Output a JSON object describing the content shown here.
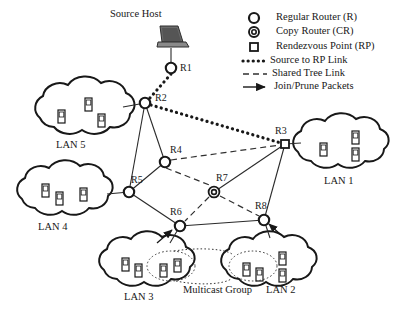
{
  "figure": {
    "source_host_label": "Source Host",
    "multicast_group_label": "Multicast Group"
  },
  "legend": {
    "items": [
      {
        "symbol": "circle-open",
        "label": "Regular Router (R)"
      },
      {
        "symbol": "double-circle",
        "label": "Copy Router (CR)"
      },
      {
        "symbol": "square-open",
        "label": "Rendezvous Point (RP)"
      },
      {
        "symbol": "thick-dotted-line",
        "label": "Source to RP  Link"
      },
      {
        "symbol": "dashed-line",
        "label": "Shared Tree Link"
      },
      {
        "symbol": "arrow-line",
        "label": "Join/Prune Packets"
      }
    ]
  },
  "nodes": [
    {
      "id": "R1",
      "label": "R1",
      "type": "regular-router",
      "x": 171,
      "y": 68,
      "lx": 180,
      "ly": 63
    },
    {
      "id": "R2",
      "label": "R2",
      "type": "regular-router",
      "x": 145,
      "y": 103,
      "lx": 155,
      "ly": 95
    },
    {
      "id": "R3",
      "label": "R3",
      "type": "rendezvous-point",
      "x": 285,
      "y": 144,
      "lx": 278,
      "ly": 131
    },
    {
      "id": "R4",
      "label": "R4",
      "type": "regular-router",
      "x": 165,
      "y": 162,
      "lx": 170,
      "ly": 148
    },
    {
      "id": "R5",
      "label": "R5",
      "type": "regular-router",
      "x": 129,
      "y": 192,
      "lx": 133,
      "ly": 178
    },
    {
      "id": "R6",
      "label": "R6",
      "type": "regular-router",
      "x": 180,
      "y": 226,
      "lx": 174,
      "ly": 210
    },
    {
      "id": "R7",
      "label": "R7",
      "type": "copy-router",
      "x": 214,
      "y": 192,
      "lx": 217,
      "ly": 178
    },
    {
      "id": "R8",
      "label": "R8",
      "type": "regular-router",
      "x": 264,
      "y": 220,
      "lx": 257,
      "ly": 206
    }
  ],
  "lans": [
    {
      "id": "LAN5",
      "label": "LAN 5",
      "cx": 82,
      "cy": 113,
      "lx": 58,
      "ly": 143,
      "hosts": 3
    },
    {
      "id": "LAN4",
      "label": "LAN 4",
      "cx": 65,
      "cy": 194,
      "lx": 41,
      "ly": 226,
      "hosts": 3
    },
    {
      "id": "LAN3",
      "label": "LAN 3",
      "cx": 148,
      "cy": 266,
      "lx": 127,
      "ly": 296,
      "hosts": 4
    },
    {
      "id": "LAN2",
      "label": "LAN 2",
      "cx": 270,
      "cy": 265,
      "lx": 270,
      "ly": 290,
      "hosts": 4
    },
    {
      "id": "LAN1",
      "label": "LAN 1",
      "cx": 340,
      "cy": 147,
      "lx": 327,
      "ly": 180,
      "hosts": 3
    }
  ],
  "links": {
    "source_to_rp": [
      "R1-R2",
      "R2-R3"
    ],
    "shared_tree": [
      "R4-R3",
      "R4-R7",
      "R7-R6",
      "R7-R8"
    ],
    "plain": [
      "R2-R5",
      "R2-R4",
      "R5-R4",
      "R5-R6",
      "R6-R8",
      "R8-R3",
      "R7-R3",
      "R2-LAN5",
      "R5-LAN4",
      "R3-LAN1",
      "R6-LAN3",
      "R8-LAN2"
    ],
    "join_prune_arrows": [
      "LAN3-R6",
      "LAN2-R8"
    ]
  },
  "colors": {
    "ink": "#181818",
    "line": "#2a2a2a",
    "laptop_body": "#6b6b6b",
    "laptop_screen": "#555555",
    "multicast_dotted": "#3a3a3a"
  }
}
